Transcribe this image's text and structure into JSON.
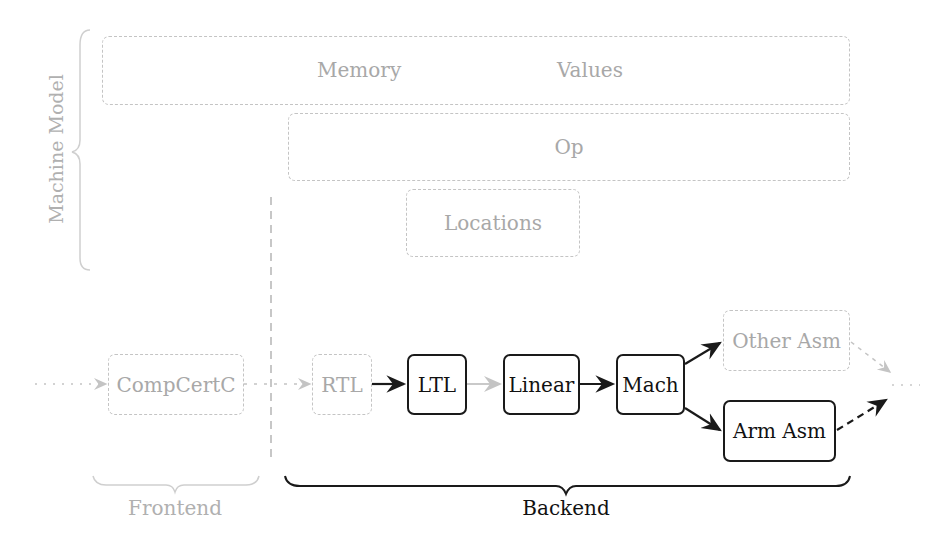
{
  "machine_model": {
    "label": "Machine Model",
    "boxes": {
      "memory_values": {
        "left": "Memory",
        "right": "Values"
      },
      "op": "Op",
      "locations": "Locations"
    }
  },
  "pipeline": {
    "nodes": [
      {
        "id": "compcertc",
        "label": "CompCertC",
        "style": "faint"
      },
      {
        "id": "rtl",
        "label": "RTL",
        "style": "faint"
      },
      {
        "id": "ltl",
        "label": "LTL",
        "style": "strong"
      },
      {
        "id": "linear",
        "label": "Linear",
        "style": "strong"
      },
      {
        "id": "mach",
        "label": "Mach",
        "style": "strong"
      },
      {
        "id": "other_asm",
        "label": "Other Asm",
        "style": "faint"
      },
      {
        "id": "arm_asm",
        "label": "Arm Asm",
        "style": "strong"
      }
    ]
  },
  "groups": {
    "frontend": "Frontend",
    "backend": "Backend"
  },
  "colors": {
    "faint": "#c4c4c4",
    "faint_text": "#a8a8a8",
    "strong": "#1a1a1a"
  }
}
